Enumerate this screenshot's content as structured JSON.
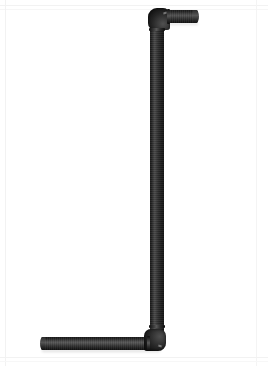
{
  "image": {
    "kind": "product-photograph",
    "subject": "black offset pipe assembly",
    "background_color": "#ffffff",
    "width_px": 268,
    "height_px": 366,
    "has_text": false,
    "caption": ""
  },
  "palette": {
    "background": "#ffffff",
    "frame_edge": "#f2f2f2",
    "pipe_dark": "#121212",
    "pipe_mid": "#2a2a2a",
    "pipe_highlight": "#565656",
    "shadow": "rgba(0,0,0,0.18)"
  },
  "parts": [
    {
      "name": "top-horizontal-arm",
      "orientation": "horizontal",
      "direction": "right",
      "x": 160,
      "y": 10,
      "length_px": 38,
      "diameter_px": 13
    },
    {
      "name": "top-elbow",
      "angle_degrees": 90,
      "turns_from": "down",
      "turns_to": "right",
      "x": 148,
      "y": 8,
      "size_px": 22
    },
    {
      "name": "vertical-riser",
      "orientation": "vertical",
      "x": 150,
      "y": 14,
      "length_px": 332,
      "diameter_px": 14
    },
    {
      "name": "bottom-elbow",
      "angle_degrees": 90,
      "turns_from": "up",
      "turns_to": "left",
      "x": 144,
      "y": 329,
      "size_px": 22
    },
    {
      "name": "bottom-horizontal-arm",
      "orientation": "horizontal",
      "direction": "left",
      "x": 41,
      "y": 337,
      "length_px": 113,
      "diameter_px": 13
    }
  ]
}
